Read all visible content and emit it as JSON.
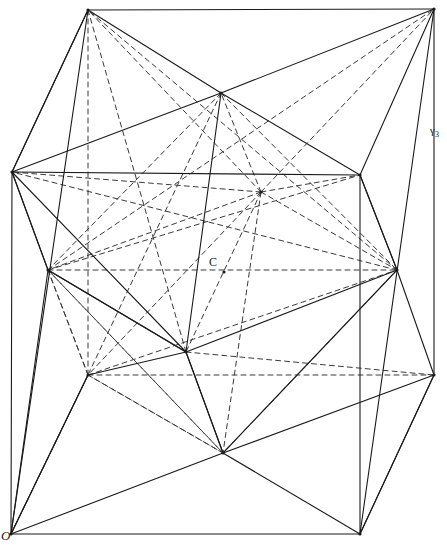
{
  "figure": {
    "background_color": "#ffffff",
    "stroke_color": "#1a1a1a",
    "dashed_color": "#3a3a3a",
    "width": 447,
    "height": 552,
    "labels": [
      {
        "id": "O",
        "text": "O",
        "x": 7,
        "y": 538,
        "style": "italic",
        "description": "origin-vertex-label"
      },
      {
        "id": "C",
        "text": "C",
        "x": 214,
        "y": 264,
        "style": "normal",
        "description": "center-point-label"
      },
      {
        "id": "gamma3",
        "text": "γ",
        "sub": "3",
        "x": 436,
        "y": 132,
        "style": "normal",
        "description": "gamma-three-label"
      }
    ],
    "points": {
      "A": {
        "x": 11,
        "y": 534,
        "name": "origin-O"
      },
      "B": {
        "x": 360,
        "y": 534,
        "name": "bottom-front-right"
      },
      "C2": {
        "x": 434,
        "y": 375,
        "name": "bottom-back-right"
      },
      "D": {
        "x": 88,
        "y": 375,
        "name": "bottom-back-left"
      },
      "E": {
        "x": 12,
        "y": 172,
        "name": "top-front-left"
      },
      "F": {
        "x": 360,
        "y": 175,
        "name": "top-front-right"
      },
      "G": {
        "x": 434,
        "y": 9,
        "name": "top-back-right"
      },
      "H": {
        "x": 88,
        "y": 10,
        "name": "top-back-left"
      },
      "M_top": {
        "x": 221,
        "y": 93,
        "name": "mid-top"
      },
      "M_bottom": {
        "x": 223,
        "y": 453,
        "name": "mid-bottom"
      },
      "M_left": {
        "x": 48,
        "y": 270,
        "name": "mid-left"
      },
      "M_right": {
        "x": 397,
        "y": 270,
        "name": "mid-right"
      },
      "M_front": {
        "x": 186,
        "y": 352,
        "name": "mid-front"
      },
      "M_back": {
        "x": 261,
        "y": 192,
        "name": "mid-back"
      },
      "Center": {
        "x": 224,
        "y": 272,
        "name": "center-C"
      }
    },
    "solid_edges": [
      [
        11,
        534,
        360,
        534
      ],
      [
        360,
        534,
        434,
        375
      ],
      [
        434,
        375,
        434,
        9
      ],
      [
        434,
        9,
        88,
        10
      ],
      [
        88,
        10,
        12,
        172
      ],
      [
        12,
        172,
        11,
        534
      ],
      [
        12,
        172,
        360,
        175
      ],
      [
        360,
        175,
        434,
        9
      ],
      [
        360,
        175,
        360,
        534
      ],
      [
        12,
        172,
        88,
        10
      ],
      [
        88,
        10,
        221,
        93
      ],
      [
        221,
        93,
        360,
        175
      ],
      [
        221,
        93,
        12,
        172
      ],
      [
        221,
        93,
        434,
        9
      ],
      [
        11,
        534,
        223,
        453
      ],
      [
        223,
        453,
        360,
        534
      ],
      [
        223,
        453,
        186,
        352
      ],
      [
        186,
        352,
        12,
        172
      ],
      [
        186,
        352,
        48,
        270
      ],
      [
        48,
        270,
        12,
        172
      ],
      [
        48,
        270,
        11,
        534
      ],
      [
        48,
        270,
        186,
        352
      ],
      [
        186,
        352,
        397,
        270
      ],
      [
        397,
        270,
        360,
        175
      ],
      [
        397,
        270,
        434,
        375
      ],
      [
        186,
        352,
        223,
        453
      ],
      [
        223,
        453,
        397,
        270
      ],
      [
        221,
        93,
        186,
        352
      ],
      [
        360,
        534,
        434,
        375
      ],
      [
        11,
        534,
        88,
        375
      ],
      [
        88,
        375,
        11,
        534
      ],
      [
        186,
        352,
        88,
        375
      ],
      [
        223,
        453,
        434,
        375
      ],
      [
        12,
        172,
        48,
        270
      ],
      [
        360,
        175,
        397,
        270
      ],
      [
        88,
        10,
        11,
        534
      ],
      [
        434,
        9,
        360,
        534
      ]
    ],
    "dashed_edges": [
      [
        88,
        10,
        88,
        375
      ],
      [
        88,
        375,
        434,
        375
      ],
      [
        88,
        375,
        48,
        270
      ],
      [
        48,
        270,
        397,
        270
      ],
      [
        48,
        270,
        88,
        375
      ],
      [
        261,
        192,
        88,
        10
      ],
      [
        261,
        192,
        434,
        9
      ],
      [
        261,
        192,
        12,
        172
      ],
      [
        261,
        192,
        360,
        175
      ],
      [
        261,
        192,
        48,
        270
      ],
      [
        261,
        192,
        397,
        270
      ],
      [
        261,
        192,
        186,
        352
      ],
      [
        261,
        192,
        223,
        453
      ],
      [
        261,
        192,
        221,
        93
      ],
      [
        261,
        192,
        88,
        375
      ],
      [
        221,
        93,
        48,
        270
      ],
      [
        221,
        93,
        397,
        270
      ],
      [
        221,
        93,
        88,
        375
      ],
      [
        223,
        453,
        88,
        375
      ],
      [
        223,
        453,
        48,
        270
      ],
      [
        11,
        534,
        88,
        375
      ],
      [
        88,
        375,
        223,
        453
      ],
      [
        88,
        375,
        397,
        270
      ],
      [
        48,
        270,
        434,
        9
      ],
      [
        48,
        270,
        360,
        175
      ],
      [
        397,
        270,
        88,
        10
      ],
      [
        397,
        270,
        12,
        172
      ],
      [
        186,
        352,
        434,
        375
      ],
      [
        186,
        352,
        88,
        10
      ],
      [
        48,
        270,
        223,
        453
      ],
      [
        397,
        270,
        223,
        453
      ]
    ]
  }
}
